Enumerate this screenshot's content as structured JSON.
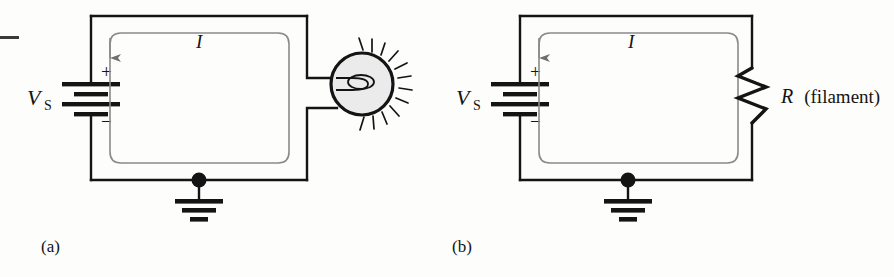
{
  "figure": {
    "kind": "circuit-diagram-pair",
    "background_color": "#fdfdfc",
    "line_color": "#141414",
    "loop_color": "#8a8a8a",
    "bulb_fill_color": "#ebebeb",
    "edge_mark": "—"
  },
  "panels": [
    {
      "id": "a",
      "caption": "(a)",
      "source_label": "V",
      "source_subscript": "S",
      "plus_sign": "+",
      "minus_sign": "−",
      "current_label": "I",
      "load_kind": "lamp",
      "load_label": "",
      "ground_label": ""
    },
    {
      "id": "b",
      "caption": "(b)",
      "source_label": "V",
      "source_subscript": "S",
      "plus_sign": "+",
      "minus_sign": "−",
      "current_label": "I",
      "load_kind": "resistor",
      "load_label": "R",
      "load_label_note": "(filament)",
      "ground_label": ""
    }
  ]
}
